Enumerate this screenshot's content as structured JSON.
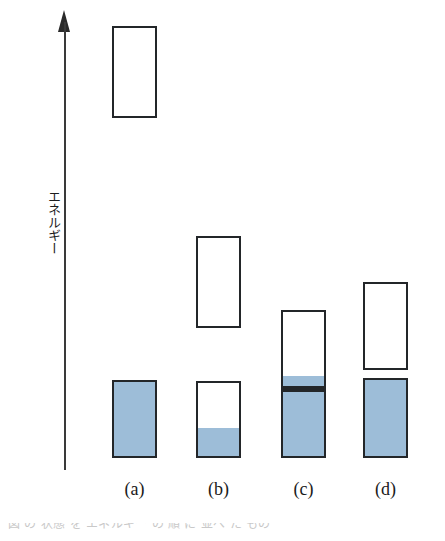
{
  "figure": {
    "background": "#ffffff",
    "width": 445,
    "height": 541
  },
  "axis": {
    "label": "エネルギー",
    "label_meaning": "Energy",
    "orientation": "vertical",
    "arrow_direction": "up",
    "line_color": "#3a3a3a",
    "arrow_color": "#2a2a2a",
    "top_y": 10,
    "bottom_y": 470
  },
  "style": {
    "fill_color": "#9dbdd8",
    "stroke_color": "#232629",
    "empty_color": "#ffffff",
    "box_width": 45
  },
  "captions": [
    {
      "label": "(a)",
      "left": 112
    },
    {
      "label": "(b)",
      "left": 196
    },
    {
      "label": "(c)",
      "left": 281
    },
    {
      "label": "(d)",
      "left": 363
    }
  ],
  "bottom_strip": {
    "text": "図 の 状態 を エネルギー の 順 に 並べ た もの"
  },
  "chart_data": {
    "type": "bar",
    "title": "",
    "xlabel": "",
    "ylabel": "エネルギー",
    "ylim": [
      0,
      1
    ],
    "grid": false,
    "legend": false,
    "categories": [
      "(a)",
      "(b)",
      "(c)",
      "(d)"
    ],
    "note": "Stacked energy-level boxes; each column shows one or two rectangles. Fill fraction encodes occupancy.",
    "columns": [
      {
        "label": "(a)",
        "left": 112,
        "boxes": [
          {
            "role": "upper-level",
            "top": 26,
            "bottom": 118,
            "height": 92,
            "fill_fraction": 0.0,
            "filled": false,
            "divider": false
          },
          {
            "role": "lower-level",
            "top": 380,
            "bottom": 458,
            "height": 78,
            "fill_fraction": 1.0,
            "filled": true,
            "divider": false
          }
        ]
      },
      {
        "label": "(b)",
        "left": 196,
        "boxes": [
          {
            "role": "upper-level",
            "top": 236,
            "bottom": 328,
            "height": 92,
            "fill_fraction": 0.0,
            "filled": false,
            "divider": false
          },
          {
            "role": "lower-level",
            "top": 381,
            "bottom": 458,
            "height": 77,
            "fill_fraction": 0.38,
            "filled": true,
            "divider": false
          }
        ]
      },
      {
        "label": "(c)",
        "left": 281,
        "boxes": [
          {
            "role": "upper-level",
            "top": 310,
            "bottom": 390,
            "height": 80,
            "fill_fraction": 0.16,
            "filled": true,
            "divider": true
          },
          {
            "role": "lower-level",
            "top": 390,
            "bottom": 458,
            "height": 68,
            "fill_fraction": 1.0,
            "filled": true,
            "divider": false
          }
        ]
      },
      {
        "label": "(d)",
        "left": 363,
        "boxes": [
          {
            "role": "upper-level",
            "top": 282,
            "bottom": 370,
            "height": 88,
            "fill_fraction": 0.0,
            "filled": false,
            "divider": false
          },
          {
            "role": "lower-level",
            "top": 378,
            "bottom": 458,
            "height": 80,
            "fill_fraction": 1.0,
            "filled": true,
            "divider": false
          }
        ]
      }
    ]
  }
}
